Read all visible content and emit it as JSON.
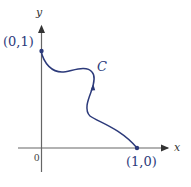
{
  "diagram": {
    "type": "parametric-curve-plot",
    "axes": {
      "x_label": "x",
      "y_label": "y",
      "origin_label": "0",
      "axis_color": "#555555"
    },
    "curve": {
      "label": "C",
      "color": "#2c3a7a",
      "start_point_label": "(1,0)",
      "end_point_label": "(0,1)",
      "direction": "from (1,0) to (0,1)"
    },
    "points": [
      {
        "label": "(0,1)",
        "x": 0,
        "y": 1
      },
      {
        "label": "(1,0)",
        "x": 1,
        "y": 0
      }
    ]
  }
}
